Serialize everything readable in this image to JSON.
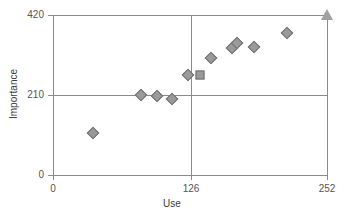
{
  "chart_data": {
    "type": "scatter",
    "title": "",
    "xlabel": "Use",
    "ylabel": "Importance",
    "xlim": [
      0,
      252
    ],
    "ylim": [
      0,
      420
    ],
    "xticks": [
      0,
      126,
      252
    ],
    "yticks": [
      0,
      210,
      420
    ],
    "xtick_labels": [
      "0",
      "126",
      "252"
    ],
    "ytick_labels": [
      "0",
      "210",
      "420"
    ],
    "grid": true,
    "grid_note": "vertical rule at x=126 and horizontal rule at y=210, plus box frame at x=252 and y=420",
    "legend": "none",
    "series": [
      {
        "name": "Items",
        "marker": "diamond",
        "color": "#9a9a9a",
        "points": [
          {
            "x": 37,
            "y": 110,
            "marker": "diamond"
          },
          {
            "x": 81,
            "y": 210,
            "marker": "diamond"
          },
          {
            "x": 96,
            "y": 208,
            "marker": "diamond"
          },
          {
            "x": 109,
            "y": 200,
            "marker": "diamond"
          },
          {
            "x": 124,
            "y": 262,
            "marker": "diamond"
          },
          {
            "x": 135,
            "y": 262,
            "marker": "square"
          },
          {
            "x": 145,
            "y": 307,
            "marker": "diamond"
          },
          {
            "x": 165,
            "y": 333,
            "marker": "diamond"
          },
          {
            "x": 169,
            "y": 346,
            "marker": "diamond"
          },
          {
            "x": 185,
            "y": 336,
            "marker": "diamond"
          },
          {
            "x": 215,
            "y": 372,
            "marker": "diamond"
          },
          {
            "x": 252,
            "y": 420,
            "marker": "triangle"
          }
        ]
      }
    ]
  },
  "colors": {
    "marker_fill": "#9a9a9a",
    "marker_stroke": "#6e6e6e",
    "axis": "#8c8c8c",
    "text": "#4a4a4a",
    "background": "#ffffff"
  }
}
